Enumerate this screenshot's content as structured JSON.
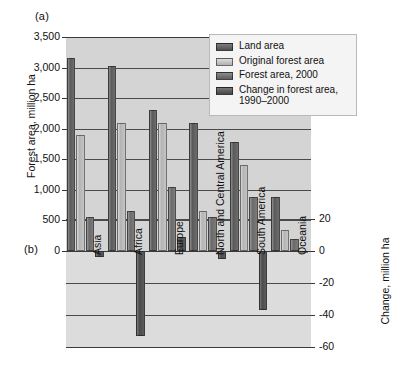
{
  "figure": {
    "panel_a_label": "(a)",
    "panel_b_label": "(b)"
  },
  "legend": {
    "items": [
      {
        "label": "Land area",
        "swatch": "land-area-swatch",
        "color": "#5f5f5f"
      },
      {
        "label": "Original forest area",
        "swatch": "original-forest-area-swatch",
        "color": "#c2c2c2"
      },
      {
        "label": "Forest area, 2000",
        "swatch": "forest-area-2000-swatch",
        "color": "#6e6e6e"
      },
      {
        "label": "Change in forest area, 1990–2000",
        "swatch": "change-in-forest-area-swatch",
        "color": "#4f4f4f"
      }
    ]
  },
  "chart_data": {
    "type": "bar",
    "title": "",
    "categories": [
      "Asia",
      "Africa",
      "Europe",
      "North and Central America",
      "South America",
      "Oceania"
    ],
    "series": [
      {
        "name": "Land area",
        "axis": "left",
        "values": [
          3150,
          3030,
          2300,
          2100,
          1780,
          880
        ]
      },
      {
        "name": "Original forest area",
        "axis": "left",
        "values": [
          1900,
          2100,
          2100,
          650,
          1400,
          350
        ]
      },
      {
        "name": "Forest area, 2000",
        "axis": "left",
        "values": [
          550,
          650,
          1050,
          550,
          880,
          200
        ]
      },
      {
        "name": "Change in forest area, 1990–2000",
        "axis": "right",
        "values": [
          -4,
          -53,
          9,
          -5,
          -37,
          -1
        ]
      }
    ],
    "left_axis": {
      "label": "Forest area, million ha",
      "ticks": [
        "3,500",
        "3,000",
        "2,500",
        "2,000",
        "1,500",
        "1,000",
        "500",
        "0"
      ],
      "tick_values": [
        3500,
        3000,
        2500,
        2000,
        1500,
        1000,
        500,
        0
      ],
      "ylim": [
        0,
        3500
      ]
    },
    "right_axis": {
      "label": "Change, million ha",
      "ticks": [
        "20",
        "0",
        "-20",
        "-40",
        "-60"
      ],
      "tick_values": [
        20,
        0,
        -20,
        -40,
        -60
      ],
      "ylim": [
        -60,
        20
      ]
    },
    "grid": true,
    "legend_position": "top-right"
  }
}
